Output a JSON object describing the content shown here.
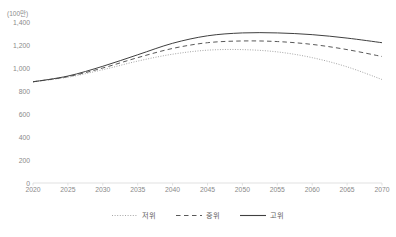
{
  "chart_data": {
    "type": "line",
    "title": "",
    "subtitle": "",
    "unit_label": "(100만)",
    "xlabel": "",
    "ylabel": "",
    "x": [
      2020,
      2025,
      2030,
      2035,
      2040,
      2045,
      2050,
      2055,
      2060,
      2065,
      2070
    ],
    "xtick_labels": [
      "2020",
      "2025",
      "2030",
      "2035",
      "2040",
      "2045",
      "2050",
      "2055",
      "2060",
      "2065",
      "2070"
    ],
    "ytick_labels": [
      "0",
      "200",
      "400",
      "600",
      "800",
      "1,000",
      "1,200",
      "1,400"
    ],
    "yticks": [
      0,
      200,
      400,
      600,
      800,
      1000,
      1200,
      1400
    ],
    "xlim": [
      2020,
      2070
    ],
    "ylim": [
      0,
      1400
    ],
    "grid": false,
    "legend_position": "bottom",
    "series": [
      {
        "name": "저위",
        "style": "dotted",
        "color": "#a6a6a6",
        "values": [
          880,
          920,
          985,
          1060,
          1120,
          1155,
          1160,
          1140,
          1090,
          1010,
          900
        ]
      },
      {
        "name": "중위",
        "style": "dashed",
        "color": "#595959",
        "values": [
          880,
          925,
          1000,
          1090,
          1170,
          1220,
          1235,
          1230,
          1205,
          1160,
          1100
        ]
      },
      {
        "name": "고위",
        "style": "solid",
        "color": "#404040",
        "values": [
          880,
          930,
          1015,
          1115,
          1215,
          1280,
          1305,
          1305,
          1290,
          1260,
          1220
        ]
      }
    ]
  },
  "legend": {
    "items": [
      {
        "label": "저위",
        "style": "dotted"
      },
      {
        "label": "중위",
        "style": "dashed"
      },
      {
        "label": "고위",
        "style": "solid"
      }
    ]
  },
  "colors": {
    "axis": "#d9d9d9",
    "tick_text": "#8a8a8a",
    "low": "#a6a6a6",
    "mid": "#595959",
    "high": "#404040",
    "background": "#ffffff"
  }
}
